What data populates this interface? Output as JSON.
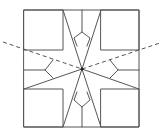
{
  "diagram": {
    "colors": {
      "stroke": "#555555",
      "center_dot": "#222222",
      "background": "#ffffff"
    },
    "outer_square": {
      "x1": 24,
      "y1": 10,
      "x2": 139,
      "y2": 127
    },
    "corner_squares": [
      {
        "name": "top-left",
        "x1": 24,
        "y1": 10,
        "x2": 63,
        "y2": 50
      },
      {
        "name": "top-right",
        "x1": 101,
        "y1": 10,
        "x2": 139,
        "y2": 50
      },
      {
        "name": "bottom-left",
        "x1": 24,
        "y1": 89,
        "x2": 63,
        "y2": 127
      },
      {
        "name": "bottom-right",
        "x1": 101,
        "y1": 89,
        "x2": 139,
        "y2": 127
      }
    ],
    "center": {
      "x": 82,
      "y": 69
    },
    "spokes": [
      {
        "x1": 63,
        "y1": 10,
        "x2": 82,
        "y2": 69
      },
      {
        "x1": 101,
        "y1": 10,
        "x2": 82,
        "y2": 69
      },
      {
        "x1": 63,
        "y1": 127,
        "x2": 82,
        "y2": 69
      },
      {
        "x1": 101,
        "y1": 127,
        "x2": 82,
        "y2": 69
      },
      {
        "x1": 24,
        "y1": 89,
        "x2": 82,
        "y2": 69
      },
      {
        "x1": 139,
        "y1": 89,
        "x2": 82,
        "y2": 69
      }
    ],
    "kites": [
      {
        "name": "top-kite",
        "points": "82,10 82,32 74,38 77,46 M82,32 90,38 87,46"
      },
      {
        "name": "bottom-kite",
        "points": "82,127 82,107 74,100 77,92 M82,107 90,100 87,92"
      },
      {
        "name": "left-kite",
        "points": "24,70 45,70 53,60 M45,70 53,78"
      },
      {
        "name": "right-kite",
        "points": "139,70 118,70 110,60 M118,70 110,78"
      }
    ],
    "dashed_lines": [
      {
        "x1": 3,
        "y1": 42,
        "x2": 82,
        "y2": 69
      },
      {
        "x1": 82,
        "y1": 69,
        "x2": 160,
        "y2": 43
      }
    ]
  }
}
